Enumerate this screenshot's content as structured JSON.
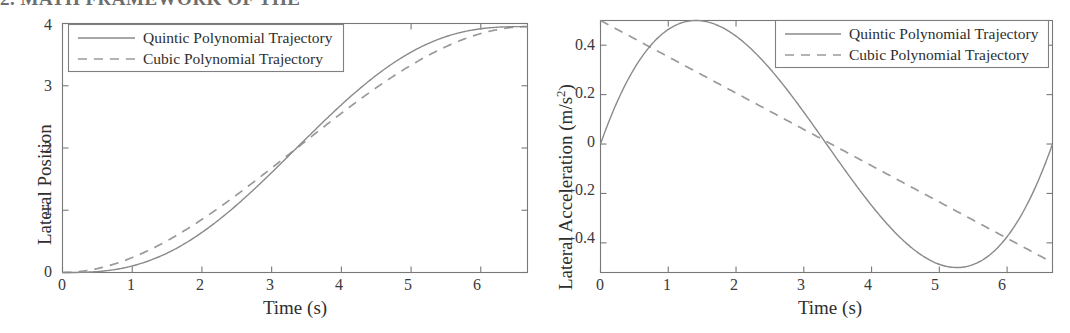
{
  "page": {
    "cut_heading_text": "2. MATH FRAMEWORK OF THE"
  },
  "figure": {
    "panels": [
      {
        "id": "lateral-position",
        "ylabel": "Lateral Position",
        "xlabel": "Time (s)",
        "x_ticks": [
          "0",
          "1",
          "2",
          "3",
          "4",
          "5",
          "6"
        ],
        "y_ticks": [
          "0",
          "1",
          "2",
          "3",
          "4"
        ],
        "legend": [
          {
            "label": "Quintic Polynomial Trajectory",
            "style": "solid"
          },
          {
            "label": "Cubic Polynomial Trajectory",
            "style": "dashed"
          }
        ]
      },
      {
        "id": "lateral-acceleration",
        "ylabel": "Lateral Acceleration (m/s",
        "ylabel_sup": "2",
        "ylabel_tail": ")",
        "xlabel": "Time (s)",
        "x_ticks": [
          "0",
          "1",
          "2",
          "3",
          "4",
          "5",
          "6"
        ],
        "y_ticks": [
          "0.4",
          "0.2",
          "0",
          "-0.2",
          "-0.4"
        ],
        "legend": [
          {
            "label": "Quintic Polynomial Trajectory",
            "style": "solid"
          },
          {
            "label": "Cubic Polynomial Trajectory",
            "style": "dashed"
          }
        ]
      }
    ]
  },
  "chart_data": [
    {
      "type": "line",
      "id": "lateral-position",
      "title": "",
      "xlabel": "Time (s)",
      "ylabel": "Lateral Position",
      "xlim": [
        0,
        6.67
      ],
      "ylim": [
        0,
        4.0
      ],
      "x_ticks": [
        0,
        1,
        2,
        3,
        4,
        5,
        6
      ],
      "y_ticks": [
        0,
        1,
        2,
        3,
        4
      ],
      "grid": false,
      "legend_position": "upper-left",
      "duration_s": 6.67,
      "final_lateral_offset_m": 3.85,
      "series": [
        {
          "name": "Quintic Polynomial Trajectory",
          "style": "solid",
          "model": "quintic_s_curve",
          "x": [
            0,
            0.33,
            0.67,
            1.0,
            1.33,
            1.67,
            2.0,
            2.33,
            2.67,
            3.0,
            3.33,
            3.67,
            4.0,
            4.33,
            4.67,
            5.0,
            5.33,
            5.67,
            6.0,
            6.33,
            6.67
          ],
          "y": [
            0.0,
            0.01,
            0.07,
            0.21,
            0.44,
            0.76,
            1.15,
            1.58,
            2.04,
            2.48,
            2.89,
            3.25,
            3.53,
            3.72,
            3.83,
            3.9,
            3.93,
            3.94,
            3.95,
            3.95,
            3.95
          ]
        },
        {
          "name": "Cubic Polynomial Trajectory",
          "style": "dashed",
          "model": "cubic_s_curve",
          "x": [
            0,
            0.33,
            0.67,
            1.0,
            1.33,
            1.67,
            2.0,
            2.33,
            2.67,
            3.0,
            3.33,
            3.67,
            4.0,
            4.33,
            4.67,
            5.0,
            5.33,
            5.67,
            6.0,
            6.33,
            6.67
          ],
          "y": [
            0.0,
            0.03,
            0.12,
            0.26,
            0.45,
            0.68,
            0.95,
            1.24,
            1.55,
            1.87,
            2.19,
            2.5,
            2.79,
            3.05,
            3.28,
            3.47,
            3.63,
            3.75,
            3.85,
            3.92,
            3.95
          ]
        }
      ]
    },
    {
      "type": "line",
      "id": "lateral-acceleration",
      "title": "",
      "xlabel": "Time (s)",
      "ylabel": "Lateral Acceleration (m/s^2)",
      "xlim": [
        0,
        6.67
      ],
      "ylim": [
        -0.52,
        0.5
      ],
      "x_ticks": [
        0,
        1,
        2,
        3,
        4,
        5,
        6
      ],
      "y_ticks": [
        0.4,
        0.2,
        0,
        -0.2,
        -0.4
      ],
      "grid": false,
      "legend_position": "upper-right",
      "series": [
        {
          "name": "Quintic Polynomial Trajectory",
          "style": "solid",
          "model": "quintic_acceleration",
          "peak_positive": {
            "t": 1.4,
            "a": 0.5
          },
          "peak_negative": {
            "t": 5.25,
            "a": -0.5
          },
          "zero_crossings": [
            0,
            3.33,
            6.67
          ],
          "x": [
            0,
            0.33,
            0.67,
            1.0,
            1.33,
            1.67,
            2.0,
            2.33,
            2.67,
            3.0,
            3.33,
            3.67,
            4.0,
            4.33,
            4.67,
            5.0,
            5.33,
            5.67,
            6.0,
            6.33,
            6.67
          ],
          "y": [
            0.0,
            0.23,
            0.39,
            0.47,
            0.5,
            0.47,
            0.41,
            0.31,
            0.19,
            0.07,
            0.0,
            -0.15,
            -0.3,
            -0.41,
            -0.48,
            -0.5,
            -0.5,
            -0.43,
            -0.29,
            -0.12,
            0.02
          ]
        },
        {
          "name": "Cubic Polynomial Trajectory",
          "style": "dashed",
          "model": "cubic_acceleration_linear",
          "start": {
            "t": 0,
            "a": 0.5
          },
          "end": {
            "t": 6.67,
            "a": -0.48
          },
          "zero_crossing_t": 3.4,
          "x": [
            0,
            1,
            2,
            3,
            4,
            5,
            6,
            6.67
          ],
          "y": [
            0.5,
            0.355,
            0.208,
            0.061,
            -0.086,
            -0.233,
            -0.38,
            -0.48
          ]
        }
      ]
    }
  ]
}
